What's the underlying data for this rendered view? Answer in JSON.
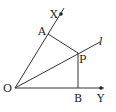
{
  "diagram": {
    "type": "geometry-angle-bisector",
    "points": {
      "O": {
        "label": "O",
        "x": 15,
        "y": 88
      },
      "X": {
        "label": "X",
        "x": 61,
        "y": 14
      },
      "Y": {
        "label": "Y",
        "x": 101,
        "y": 88
      },
      "A": {
        "label": "A",
        "x": 48,
        "y": 34
      },
      "P": {
        "label": "P",
        "x": 78,
        "y": 53
      },
      "B": {
        "label": "B",
        "x": 78,
        "y": 88
      }
    },
    "line_label": "l",
    "segments": [
      "OX",
      "OY",
      "Ol",
      "AP",
      "PB"
    ],
    "colors": {
      "stroke": "#333333",
      "text": "#222222",
      "background": "#ffffff"
    }
  }
}
